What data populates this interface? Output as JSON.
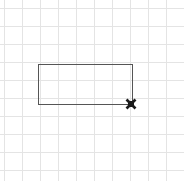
{
  "canvas": {
    "width": 184,
    "height": 181,
    "background_color": "#ffffff",
    "label": "drawing-canvas"
  },
  "grid": {
    "visible": true,
    "spacing_px": 18,
    "origin_x": 4,
    "origin_y": 8,
    "line_color": "#e4e4e4",
    "line_width": 1,
    "vertical_lines": [
      4,
      22,
      40,
      58,
      76,
      94,
      112,
      130,
      148,
      166,
      184
    ],
    "horizontal_lines": [
      8,
      26,
      44,
      62,
      80,
      98,
      116,
      134,
      152,
      170
    ],
    "label": "background-grid"
  },
  "shapes": [
    {
      "type": "rectangle",
      "name": "drawn-rectangle",
      "x": 38,
      "y": 64,
      "width": 94,
      "height": 40,
      "stroke_color": "#555555",
      "stroke_width": 1.6,
      "fill": "none",
      "corners": {
        "top_left": [
          38,
          64
        ],
        "top_right": [
          132,
          64
        ],
        "bottom_right": [
          132,
          104
        ],
        "bottom_left": [
          38,
          104
        ]
      }
    }
  ],
  "cursor": {
    "name": "x-cursor-marker",
    "type": "x-marker",
    "x": 131,
    "y": 104,
    "size": 11,
    "color": "#1a1a1a",
    "label": "drawing cursor at rectangle bottom-right corner"
  }
}
